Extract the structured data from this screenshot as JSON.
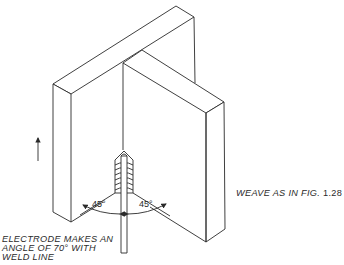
{
  "figure": {
    "type": "isometric technical drawing",
    "colors": {
      "line": "#2a2a2a",
      "background": "#ffffff"
    }
  },
  "labels": {
    "electrode_note": {
      "line1": "ELECTRODE MAKES AN",
      "line2": "ANGLE OF 70° WITH",
      "line3": "WELD LINE"
    },
    "weave_note": {
      "text": "WEAVE AS IN FIG.",
      "fig_ref": "1.28"
    },
    "angle_left": "45°",
    "angle_right": "45°"
  },
  "icons": {
    "direction_arrow": "up-arrow-icon"
  }
}
